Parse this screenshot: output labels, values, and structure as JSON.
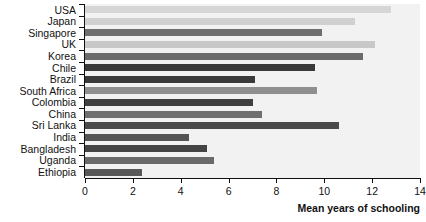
{
  "chart_data": {
    "type": "bar",
    "orientation": "horizontal",
    "title": "",
    "xlabel": "Mean years of schooling",
    "ylabel": "",
    "xlim": [
      0,
      14
    ],
    "xticks": [
      0,
      2,
      4,
      6,
      8,
      10,
      12,
      14
    ],
    "grid": false,
    "legend": "none",
    "categories": [
      "USA",
      "Japan",
      "Singapore",
      "UK",
      "Korea",
      "Chile",
      "Brazil",
      "South Africa",
      "Colombia",
      "China",
      "Sri Lanka",
      "India",
      "Bangladesh",
      "Uganda",
      "Ethiopia"
    ],
    "values": [
      12.8,
      11.3,
      9.9,
      12.1,
      11.6,
      9.6,
      7.1,
      9.7,
      7.0,
      7.4,
      10.6,
      4.35,
      5.1,
      5.4,
      2.4
    ],
    "bar_colors": [
      "#d6d6d6",
      "#d0d0d0",
      "#6e6e6e",
      "#c8c8c8",
      "#6b6b6b",
      "#3a3a3a",
      "#3a3a3a",
      "#8f8f8f",
      "#3f3f3f",
      "#6f6f6f",
      "#4a4a4a",
      "#555555",
      "#444444",
      "#6a6a6a",
      "#585858"
    ],
    "plot_background": "#f2f2f2",
    "axis_color": "#111111"
  },
  "axis": {
    "x_title": "Mean years of schooling",
    "tick_labels": [
      "0",
      "2",
      "4",
      "6",
      "8",
      "10",
      "12",
      "14"
    ]
  }
}
